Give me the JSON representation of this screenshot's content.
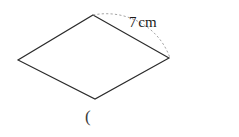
{
  "figure": {
    "type": "rhombus",
    "shape_name": "rhombus-outline",
    "stroke_color": "#2b2b2b",
    "fill_color": "none",
    "background_color": "#ffffff",
    "vertices": {
      "top": {
        "x": 93,
        "y": 15
      },
      "right": {
        "x": 169,
        "y": 58
      },
      "bottom": {
        "x": 95,
        "y": 99
      },
      "left": {
        "x": 18,
        "y": 60
      }
    },
    "arc": {
      "name": "side-length-arc",
      "style": "dashed",
      "stroke_color": "#8a8a8a",
      "from": {
        "x": 93,
        "y": 15
      },
      "to": {
        "x": 169,
        "y": 58
      }
    }
  },
  "labels": {
    "side_measure": {
      "value": "7",
      "unit": "cm",
      "full_text": "7 cm"
    },
    "stray_text": "("
  }
}
